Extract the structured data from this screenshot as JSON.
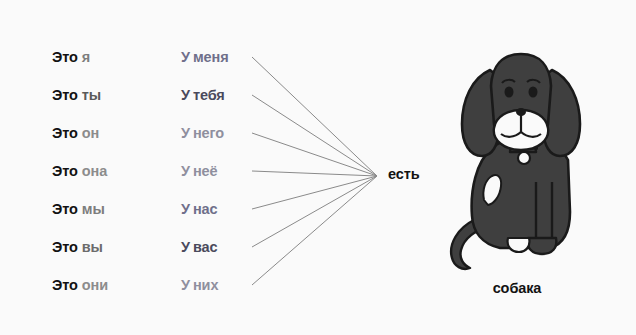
{
  "canvas": {
    "width": 636,
    "height": 335,
    "background_color": "#fafafa"
  },
  "palette": {
    "text_dark": "#121212",
    "pronoun_gray_dark": "#4a4a4a",
    "pronoun_gray_mid": "#6b6b6b",
    "pronoun_gray_light": "#8c8c8c",
    "line_color": "#8a8a8a",
    "dog_body": "#3f3f3f",
    "dog_outline": "#1a1a1a",
    "dog_white": "#fafafa"
  },
  "subject_column": {
    "lead_word": "Это",
    "rows": [
      {
        "pronoun": "я",
        "color": "#7d7d7d"
      },
      {
        "pronoun": "ты",
        "color": "#5a5a5a"
      },
      {
        "pronoun": "он",
        "color": "#8c8c8c"
      },
      {
        "pronoun": "она",
        "color": "#8c8c8c"
      },
      {
        "pronoun": "мы",
        "color": "#7d7d7d"
      },
      {
        "pronoun": "вы",
        "color": "#6b6b6b"
      },
      {
        "pronoun": "они",
        "color": "#8c8c8c"
      }
    ]
  },
  "possessive_column": {
    "lead_letter": "У",
    "rows": [
      {
        "word": "меня",
        "color": "#6f6f8a"
      },
      {
        "word": "тебя",
        "color": "#4a4a5c"
      },
      {
        "word": "него",
        "color": "#8f8f9e"
      },
      {
        "word": "неё",
        "color": "#8f8f9e"
      },
      {
        "word": "нас",
        "color": "#6f6f8a"
      },
      {
        "word": "вас",
        "color": "#4a4a5c"
      },
      {
        "word": "них",
        "color": "#8f8f9e"
      }
    ]
  },
  "connector": {
    "description": "seven straight lines fanning from each possessive row to a single convergence point",
    "origin_x": 252,
    "convergence_x": 377,
    "convergence_y": 176,
    "row_y": [
      57,
      95,
      133,
      171,
      209,
      247,
      285
    ],
    "color": "#8a8a8a",
    "stroke_width": 1
  },
  "verb": {
    "label": "есть"
  },
  "illustration": {
    "caption": "собака",
    "subject": "dog-illustration",
    "alt": "cartoon dog with long floppy ears, white muzzle, collar tag, white chest spot and curled tail"
  }
}
